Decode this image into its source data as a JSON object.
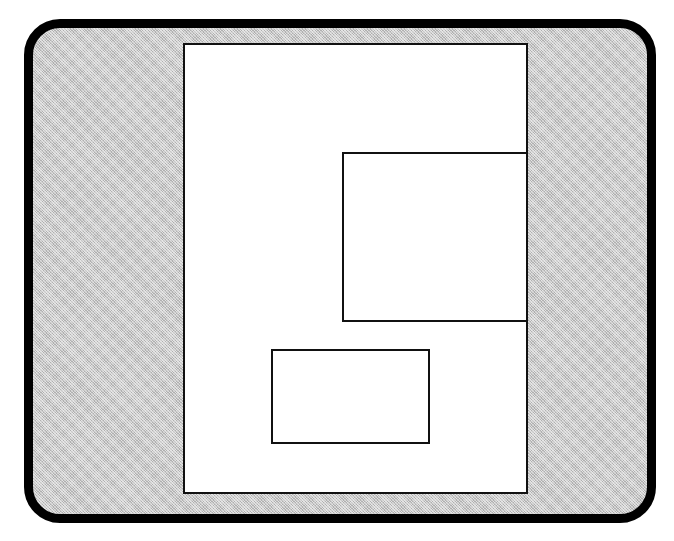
{
  "diagram": {
    "type": "page-layout",
    "screen": {
      "background": "#c8c8c8",
      "border_color": "#000000",
      "pattern": "dither-gray"
    },
    "page": {
      "background": "#ffffff",
      "border_color": "#111111"
    },
    "frames": [
      {
        "id": "frame-right",
        "position": "right-middle, flush with page right edge"
      },
      {
        "id": "frame-bottom",
        "position": "lower-center"
      }
    ]
  }
}
